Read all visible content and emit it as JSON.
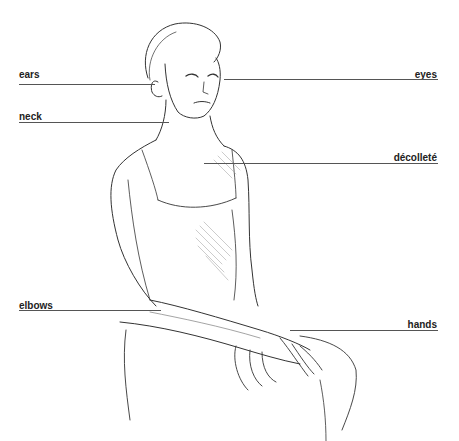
{
  "diagram": {
    "type": "labeled-illustration",
    "labels": [
      {
        "text": "ears",
        "side": "left"
      },
      {
        "text": "neck",
        "side": "left"
      },
      {
        "text": "elbows",
        "side": "left"
      },
      {
        "text": "eyes",
        "side": "right"
      },
      {
        "text": "décolleté",
        "side": "right"
      },
      {
        "text": "hands",
        "side": "right"
      }
    ]
  }
}
